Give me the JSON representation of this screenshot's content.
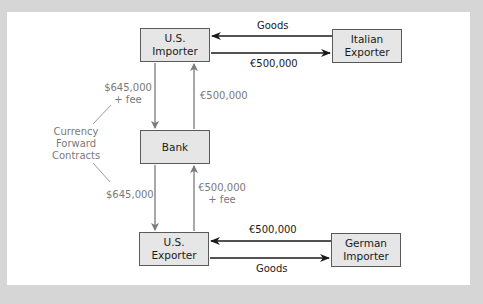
{
  "diagram": {
    "colors": {
      "frame": "#d6d6d6",
      "panel": "#ffffff",
      "box_fill": "#e6e6e6",
      "box_border": "#5a5a5a",
      "dark_arrow": "#1a1a1a",
      "grey_arrow": "#7a7a7a"
    },
    "nodes": {
      "us_importer": {
        "line1": "U.S.",
        "line2": "Importer"
      },
      "italian_exporter": {
        "line1": "Italian",
        "line2": "Exporter"
      },
      "bank": {
        "label": "Bank"
      },
      "us_exporter": {
        "line1": "U.S.",
        "line2": "Exporter"
      },
      "german_importer": {
        "line1": "German",
        "line2": "Importer"
      }
    },
    "edges": {
      "italian_to_us_importer": "Goods",
      "us_importer_to_italian": "€500,000",
      "us_importer_to_bank_line1": "$645,000",
      "us_importer_to_bank_line2": "+ fee",
      "bank_to_us_importer": "€500,000",
      "bank_to_us_exporter": "$645,000",
      "us_exporter_to_bank_line1": "€500,000",
      "us_exporter_to_bank_line2": "+ fee",
      "german_to_us_exporter": "€500,000",
      "us_exporter_to_german": "Goods"
    },
    "annotation": {
      "line1": "Currency",
      "line2": "Forward",
      "line3": "Contracts"
    }
  }
}
